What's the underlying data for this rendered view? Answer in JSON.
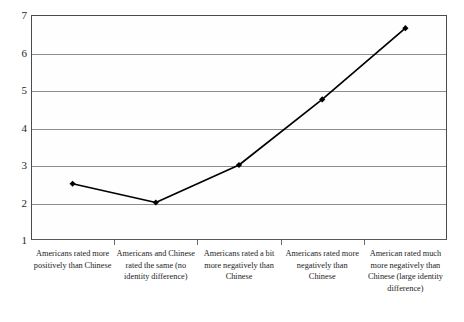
{
  "chart_data": {
    "type": "line",
    "title": "",
    "subtitle": "",
    "xlabel": "",
    "ylabel": "",
    "ylim": [
      1,
      7
    ],
    "y_ticks": [
      1,
      2,
      3,
      4,
      5,
      6,
      7
    ],
    "grid": true,
    "legend": false,
    "legend_position": "none",
    "marker": "diamond",
    "line_color": "#000000",
    "marker_color": "#000000",
    "gridline_color": "#8d8d8d",
    "background_color": "#ffffff",
    "categories": [
      "Americans rated more positively than Chinese",
      "Americans and Chinese rated the same (no identity difference)",
      "Americans rated a bit more negatively than Chinese",
      "Americans rated more negatively than Chinese",
      "American rated much more negatively than Chinese (large identity difference)"
    ],
    "values": [
      2.5,
      2.0,
      3.0,
      4.75,
      6.65
    ],
    "series": [
      {
        "name": "",
        "values": [
          2.5,
          2.0,
          3.0,
          4.75,
          6.65
        ]
      }
    ]
  },
  "axis": {
    "y_tick_labels": [
      "7",
      "6",
      "5",
      "4",
      "3",
      "2",
      "1"
    ]
  },
  "x_axis": {
    "categories": [
      "Americans rated more positively than Chinese",
      "Americans and Chinese rated the same (no identity difference)",
      "Americans rated a bit more negatively than Chinese",
      "Americans rated more negatively than Chinese",
      "American rated much more negatively than Chinese (large identity difference)"
    ]
  }
}
